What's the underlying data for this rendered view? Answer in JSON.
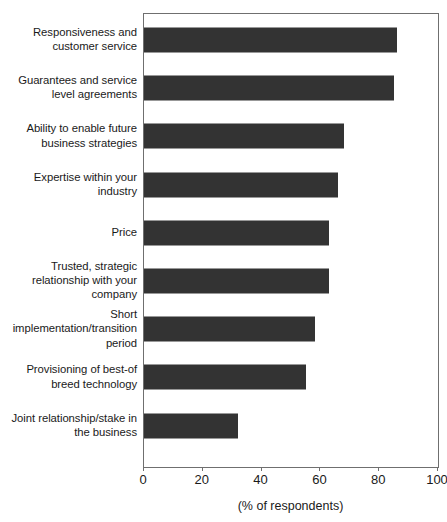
{
  "chart_data": {
    "type": "bar",
    "orientation": "horizontal",
    "title": "",
    "subtitle": "",
    "xlabel": "(% of respondents)",
    "ylabel": "",
    "xlim": [
      0,
      100
    ],
    "xticks": [
      0,
      20,
      40,
      60,
      80,
      100
    ],
    "xtick_labels": [
      "0",
      "20",
      "40",
      "60",
      "80",
      "100"
    ],
    "grid": false,
    "legend": null,
    "bar_color": "#333333",
    "frame_color": "#6f6f6f",
    "background": "#ffffff",
    "categories": [
      "Responsiveness and\ncustomer service",
      "Guarantees and service\nlevel agreements",
      "Ability to enable future\nbusiness strategies",
      "Expertise within your\nindustry",
      "Price",
      "Trusted, strategic\nrelationship with your\ncompany",
      "Short\nimplementation/transition\nperiod",
      "Provisioning of best-of\nbreed technology",
      "Joint relationship/stake in\nthe business"
    ],
    "values": [
      86,
      85,
      68,
      66,
      63,
      63,
      58,
      55,
      32
    ]
  }
}
